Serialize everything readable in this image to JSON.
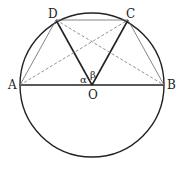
{
  "diagram": {
    "type": "geometry",
    "circle": {
      "center": "O",
      "cx": 92,
      "cy": 85,
      "r": 72
    },
    "points": {
      "A": {
        "label": "A",
        "x": 20,
        "y": 85
      },
      "B": {
        "label": "B",
        "x": 164,
        "y": 85
      },
      "C": {
        "label": "C",
        "x": 128,
        "y": 20
      },
      "D": {
        "label": "D",
        "x": 56,
        "y": 20
      },
      "O": {
        "label": "O",
        "x": 92,
        "y": 85
      }
    },
    "angles": {
      "alpha": "α",
      "beta": "β"
    },
    "segments_solid_thick": [
      "AB",
      "OD",
      "OC"
    ],
    "segments_solid_thin": [
      "AD",
      "DC",
      "CB"
    ],
    "segments_dashed": [
      "AC",
      "DB"
    ]
  }
}
